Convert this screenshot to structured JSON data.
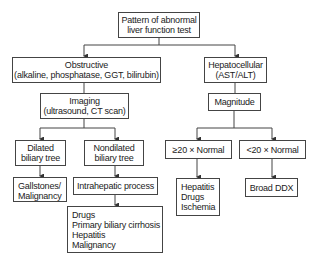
{
  "diagram": {
    "root": {
      "lines": [
        "Pattern of abnormal",
        "liver function test"
      ]
    },
    "obstructive": {
      "lines": [
        "Obstructive",
        "(alkaline, phosphatase, GGT, bilirubin)"
      ]
    },
    "hepatocellular": {
      "lines": [
        "Hepatocellular",
        "(AST/ALT)"
      ]
    },
    "imaging": {
      "lines": [
        "Imaging",
        "(ultrasound, CT scan)"
      ]
    },
    "magnitude": {
      "lines": [
        "Magnitude"
      ]
    },
    "dilated": {
      "lines": [
        "Dilated",
        "biliary tree"
      ]
    },
    "nondilated": {
      "lines": [
        "Nondilated",
        "biliary tree"
      ]
    },
    "ge20": {
      "lines": [
        "≥20 × Normal"
      ]
    },
    "lt20": {
      "lines": [
        "<20 × Normal"
      ]
    },
    "gallstones": {
      "lines": [
        "Gallstones/",
        "Malignancy"
      ]
    },
    "intrahepatic": {
      "lines": [
        "Intrahepatic process"
      ]
    },
    "intrahepatic_causes": {
      "lines": [
        "Drugs",
        "Primary biliary cirrhosis",
        "Hepatitis",
        "Malignancy"
      ]
    },
    "hepatocellular_causes": {
      "lines": [
        "Hepatitis",
        "Drugs",
        "Ischemia"
      ]
    },
    "broad_ddx": {
      "lines": [
        "Broad DDX"
      ]
    }
  }
}
